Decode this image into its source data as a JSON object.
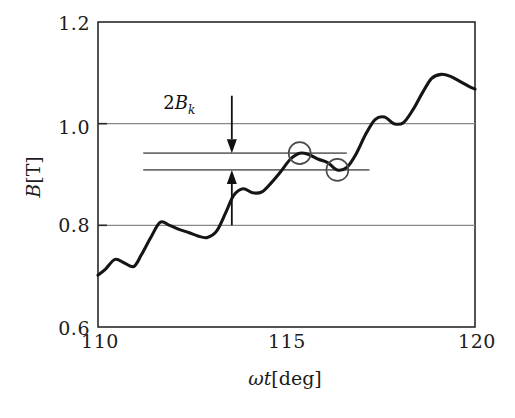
{
  "figure": {
    "domain": "chart",
    "background_color": "#ffffff",
    "line_color": "#151515",
    "grid_color": "#888888",
    "frame_color": "#2a2a2a"
  },
  "axes": {
    "x": {
      "label": "ωt[deg]",
      "label_symbol": "ωt",
      "label_unit": "[deg]",
      "ticks": [
        "110",
        "115",
        "120"
      ],
      "tick_values": [
        110,
        115,
        120
      ],
      "min": 110,
      "max": 120
    },
    "y": {
      "label": "B[T]",
      "label_symbol": "B",
      "label_unit": "[T]",
      "ticks": [
        "1.2",
        "1.0",
        "0.8",
        "0.6"
      ],
      "tick_values": [
        1.2,
        1.0,
        0.8,
        0.6
      ],
      "min": 0.6,
      "max": 1.2,
      "gridlines": [
        1.0,
        0.8
      ]
    }
  },
  "annotations": {
    "bk_label": "2B",
    "bk_subscript": "k",
    "bk_label_full": "2Bₖ",
    "band_upper_value": 0.942,
    "band_lower_value": 0.909,
    "arrow_down_from": 1.055,
    "arrow_down_to": 0.942,
    "arrow_up_from": 0.8,
    "arrow_up_to": 0.909
  },
  "chart_data": {
    "type": "line",
    "title": "",
    "xlabel": "ωt[deg]",
    "ylabel": "B[T]",
    "xlim": [
      110,
      120
    ],
    "ylim": [
      0.6,
      1.2
    ],
    "grid": true,
    "gridlines_y": [
      1.0,
      0.8
    ],
    "legend": null,
    "series": [
      {
        "name": "B",
        "x": [
          110.0,
          110.2,
          110.45,
          110.7,
          110.95,
          111.15,
          111.4,
          111.65,
          111.9,
          112.15,
          112.4,
          112.65,
          112.9,
          113.15,
          113.4,
          113.6,
          113.85,
          114.1,
          114.35,
          114.6,
          114.85,
          115.1,
          115.35,
          115.6,
          115.85,
          116.1,
          116.35,
          116.6,
          116.85,
          117.1,
          117.35,
          117.6,
          117.85,
          118.1,
          118.35,
          118.6,
          118.85,
          119.1,
          119.35,
          119.6,
          119.85,
          120.0
        ],
        "y": [
          0.702,
          0.714,
          0.733,
          0.726,
          0.719,
          0.742,
          0.776,
          0.806,
          0.8,
          0.792,
          0.786,
          0.779,
          0.776,
          0.789,
          0.827,
          0.859,
          0.872,
          0.864,
          0.866,
          0.884,
          0.906,
          0.93,
          0.942,
          0.939,
          0.93,
          0.923,
          0.909,
          0.914,
          0.941,
          0.979,
          1.008,
          1.013,
          1.0,
          1.002,
          1.027,
          1.06,
          1.089,
          1.097,
          1.093,
          1.083,
          1.073,
          1.068
        ]
      }
    ],
    "markers": [
      {
        "shape": "circle-open",
        "x": 115.35,
        "y": 0.942
      },
      {
        "shape": "circle-open",
        "x": 116.35,
        "y": 0.909
      }
    ],
    "horizontal_bands": [
      {
        "y": 0.942,
        "x_start": 111.2,
        "x_end": 116.6
      },
      {
        "y": 0.909,
        "x_start": 111.2,
        "x_end": 117.2
      }
    ],
    "annotations": [
      {
        "text": "2B_k",
        "x": 112.9,
        "y": 1.035,
        "type": "label"
      },
      {
        "text": "",
        "type": "arrow-down",
        "x": 113.55,
        "y_from": 1.055,
        "y_to": 0.942
      },
      {
        "text": "",
        "type": "arrow-up",
        "x": 113.55,
        "y_from": 0.8,
        "y_to": 0.909
      }
    ]
  }
}
